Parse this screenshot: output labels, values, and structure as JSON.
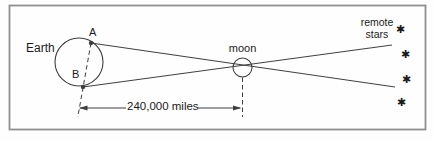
{
  "figure": {
    "colors": {
      "bg": "#fefefe",
      "border": "#8f8f8f",
      "line": "#3f3f3f",
      "text": "#1a1a1a"
    },
    "labels": {
      "earth": "Earth",
      "point_a": "A",
      "point_b": "B",
      "moon": "moon",
      "distance": "240,000 miles",
      "remote_stars": {
        "line1": "remote",
        "line2": "stars"
      }
    },
    "stars": {
      "glyph": "✱",
      "count": 4
    }
  }
}
